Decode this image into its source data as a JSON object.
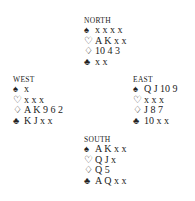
{
  "hands": {
    "north": {
      "label": "NORTH",
      "spades": "x x x x",
      "hearts": "A K x x",
      "diamonds": "10 4 3",
      "clubs": "x x"
    },
    "west": {
      "label": "WEST",
      "spades": "x",
      "hearts": "x x x",
      "diamonds": "A K 9 6 2",
      "clubs": "K J x x"
    },
    "east": {
      "label": "EAST",
      "spades": "Q J 10 9",
      "hearts": "x x x",
      "diamonds": "J 8 7",
      "clubs": "10 x x"
    },
    "south": {
      "label": "SOUTH",
      "spades": "A K x x",
      "hearts": "Q J x",
      "diamonds": "Q 5",
      "clubs": "A Q x x"
    }
  },
  "suit_symbols": {
    "spades": "♠",
    "hearts": "♡",
    "diamonds": "♢",
    "clubs": "♣"
  }
}
